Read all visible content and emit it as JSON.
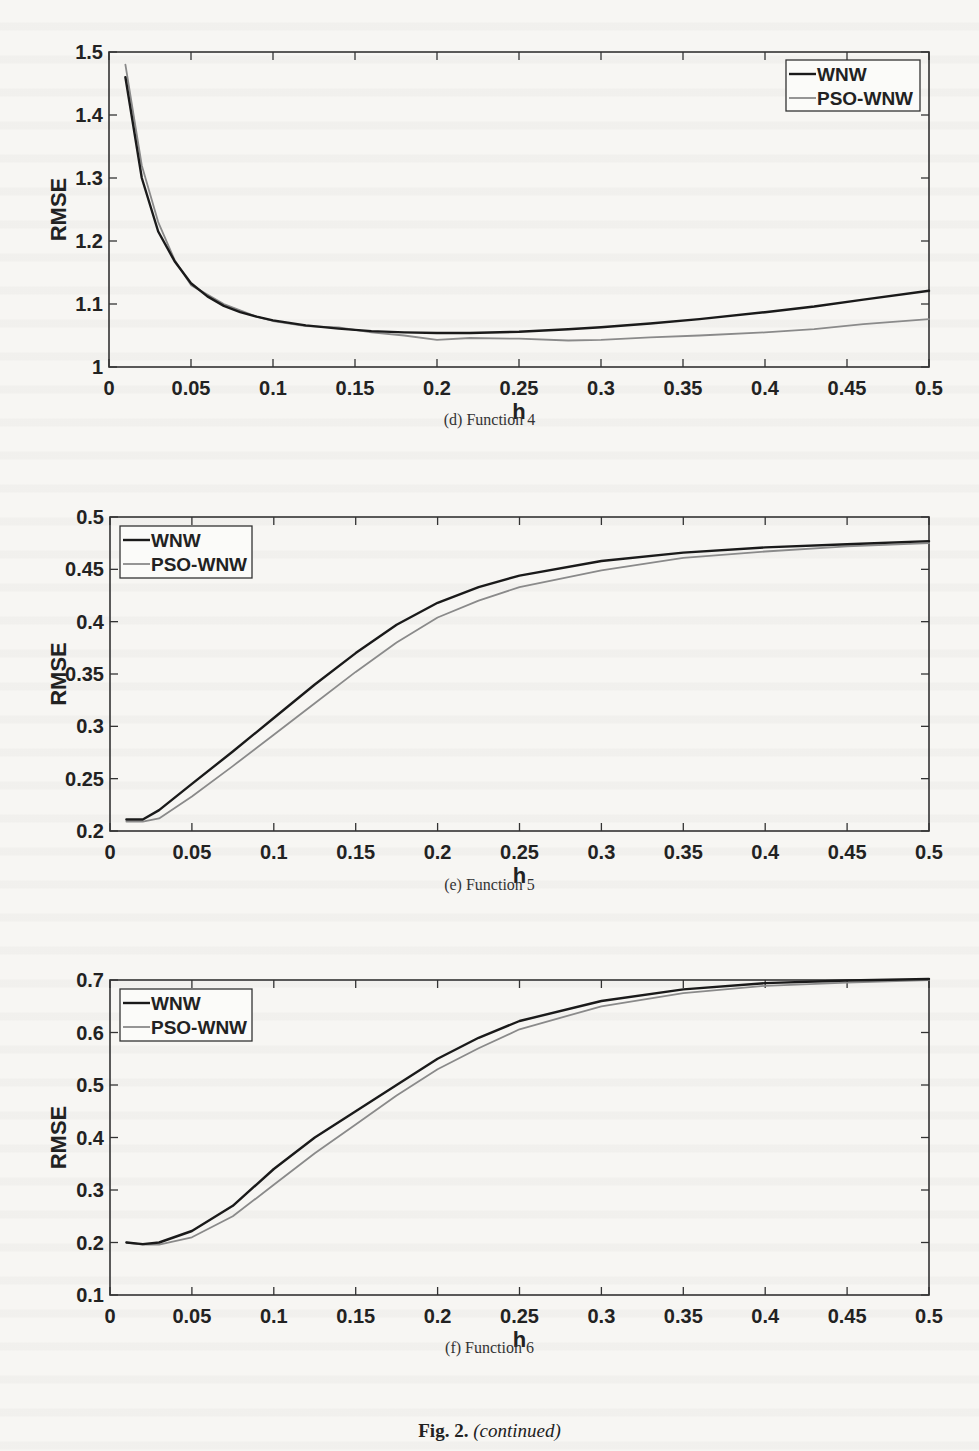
{
  "figure": {
    "label": "Fig. 2.",
    "note": "(continued)"
  },
  "chart_data": [
    {
      "id": "d",
      "type": "line",
      "caption": "(d) Function 4",
      "title": "",
      "xlabel": "h",
      "ylabel": "RMSE",
      "xlim": [
        0,
        0.5
      ],
      "ylim": [
        1,
        1.5
      ],
      "xticks": [
        0,
        0.05,
        0.1,
        0.15,
        0.2,
        0.25,
        0.3,
        0.35,
        0.4,
        0.45,
        0.5
      ],
      "xtick_labels": [
        "0",
        "0.05",
        "0.1",
        "0.15",
        "0.2",
        "0.25",
        "0.3",
        "0.35",
        "0.4",
        "0.45",
        "0.5"
      ],
      "yticks": [
        1,
        1.1,
        1.2,
        1.3,
        1.4,
        1.5
      ],
      "ytick_labels": [
        "1",
        "1.1",
        "1.2",
        "1.3",
        "1.4",
        "1.5"
      ],
      "grid": false,
      "legend_position": "upper right",
      "frame": {
        "left": 109,
        "right": 929,
        "top": 52,
        "bottom": 367
      },
      "legend_box": {
        "x": 786,
        "y": 60,
        "w": 134,
        "h": 51
      },
      "x": [
        0.01,
        0.02,
        0.03,
        0.04,
        0.05,
        0.06,
        0.07,
        0.08,
        0.09,
        0.1,
        0.12,
        0.14,
        0.16,
        0.18,
        0.2,
        0.22,
        0.25,
        0.28,
        0.3,
        0.33,
        0.36,
        0.4,
        0.43,
        0.46,
        0.5
      ],
      "series": [
        {
          "name": "WNW",
          "color": "#1a1a1a",
          "width": 2.4,
          "values": [
            1.46,
            1.3,
            1.215,
            1.168,
            1.133,
            1.112,
            1.097,
            1.087,
            1.08,
            1.074,
            1.066,
            1.061,
            1.057,
            1.055,
            1.054,
            1.054,
            1.056,
            1.06,
            1.063,
            1.069,
            1.076,
            1.087,
            1.096,
            1.107,
            1.121
          ]
        },
        {
          "name": "PSO-WNW",
          "color": "#8a8a8a",
          "width": 1.8,
          "values": [
            1.48,
            1.32,
            1.23,
            1.17,
            1.13,
            1.115,
            1.1,
            1.09,
            1.08,
            1.073,
            1.065,
            1.063,
            1.055,
            1.05,
            1.043,
            1.046,
            1.045,
            1.042,
            1.043,
            1.047,
            1.05,
            1.055,
            1.06,
            1.068,
            1.076
          ]
        }
      ]
    },
    {
      "id": "e",
      "type": "line",
      "caption": "(e) Function 5",
      "title": "",
      "xlabel": "h",
      "ylabel": "RMSE",
      "xlim": [
        0,
        0.5
      ],
      "ylim": [
        0.2,
        0.5
      ],
      "xticks": [
        0,
        0.05,
        0.1,
        0.15,
        0.2,
        0.25,
        0.3,
        0.35,
        0.4,
        0.45,
        0.5
      ],
      "xtick_labels": [
        "0",
        "0.05",
        "0.1",
        "0.15",
        "0.2",
        "0.25",
        "0.3",
        "0.35",
        "0.4",
        "0.45",
        "0.5"
      ],
      "yticks": [
        0.2,
        0.25,
        0.3,
        0.35,
        0.4,
        0.45,
        0.5
      ],
      "ytick_labels": [
        "0.2",
        "0.25",
        "0.3",
        "0.35",
        "0.4",
        "0.45",
        "0.5"
      ],
      "grid": false,
      "legend_position": "upper left",
      "frame": {
        "left": 110,
        "right": 929,
        "top": 517,
        "bottom": 831
      },
      "legend_box": {
        "x": 120,
        "y": 526,
        "w": 132,
        "h": 52
      },
      "x": [
        0.01,
        0.02,
        0.03,
        0.05,
        0.075,
        0.1,
        0.125,
        0.15,
        0.175,
        0.2,
        0.225,
        0.25,
        0.3,
        0.35,
        0.4,
        0.45,
        0.5
      ],
      "series": [
        {
          "name": "WNW",
          "color": "#1a1a1a",
          "width": 2.4,
          "values": [
            0.211,
            0.211,
            0.22,
            0.245,
            0.276,
            0.308,
            0.34,
            0.37,
            0.397,
            0.418,
            0.433,
            0.444,
            0.458,
            0.466,
            0.471,
            0.474,
            0.477
          ]
        },
        {
          "name": "PSO-WNW",
          "color": "#8a8a8a",
          "width": 1.8,
          "values": [
            0.209,
            0.209,
            0.212,
            0.233,
            0.262,
            0.292,
            0.322,
            0.352,
            0.38,
            0.404,
            0.42,
            0.433,
            0.449,
            0.461,
            0.467,
            0.472,
            0.475
          ]
        }
      ]
    },
    {
      "id": "f",
      "type": "line",
      "caption": "(f) Function 6",
      "title": "",
      "xlabel": "h",
      "ylabel": "RMSE",
      "xlim": [
        0,
        0.5
      ],
      "ylim": [
        0.1,
        0.7
      ],
      "xticks": [
        0,
        0.05,
        0.1,
        0.15,
        0.2,
        0.25,
        0.3,
        0.35,
        0.4,
        0.45,
        0.5
      ],
      "xtick_labels": [
        "0",
        "0.05",
        "0.1",
        "0.15",
        "0.2",
        "0.25",
        "0.3",
        "0.35",
        "0.4",
        "0.45",
        "0.5"
      ],
      "yticks": [
        0.1,
        0.2,
        0.3,
        0.4,
        0.5,
        0.6,
        0.7
      ],
      "ytick_labels": [
        "0.1",
        "0.2",
        "0.3",
        "0.4",
        "0.5",
        "0.6",
        "0.7"
      ],
      "grid": false,
      "legend_position": "upper left",
      "frame": {
        "left": 110,
        "right": 929,
        "top": 980,
        "bottom": 1295
      },
      "legend_box": {
        "x": 120,
        "y": 989,
        "w": 132,
        "h": 52
      },
      "x": [
        0.01,
        0.02,
        0.03,
        0.05,
        0.075,
        0.1,
        0.125,
        0.15,
        0.175,
        0.2,
        0.225,
        0.25,
        0.3,
        0.35,
        0.4,
        0.45,
        0.5
      ],
      "series": [
        {
          "name": "WNW",
          "color": "#1a1a1a",
          "width": 2.4,
          "values": [
            0.2,
            0.197,
            0.2,
            0.222,
            0.27,
            0.34,
            0.4,
            0.45,
            0.5,
            0.55,
            0.59,
            0.622,
            0.66,
            0.682,
            0.694,
            0.699,
            0.702
          ]
        },
        {
          "name": "PSO-WNW",
          "color": "#8a8a8a",
          "width": 1.8,
          "values": [
            0.2,
            0.196,
            0.196,
            0.21,
            0.25,
            0.31,
            0.37,
            0.425,
            0.48,
            0.53,
            0.57,
            0.606,
            0.65,
            0.675,
            0.689,
            0.695,
            0.7
          ]
        }
      ]
    }
  ]
}
